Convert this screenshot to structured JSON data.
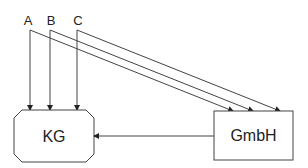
{
  "diagram": {
    "sources": [
      {
        "id": "A",
        "label": "A"
      },
      {
        "id": "B",
        "label": "B"
      },
      {
        "id": "C",
        "label": "C"
      }
    ],
    "nodes": {
      "kg": {
        "label": "KG",
        "shape": "octagon"
      },
      "gmbh": {
        "label": "GmbH",
        "shape": "rectangle"
      }
    },
    "edges": [
      {
        "from": "A",
        "to": "KG"
      },
      {
        "from": "B",
        "to": "KG"
      },
      {
        "from": "C",
        "to": "KG"
      },
      {
        "from": "A",
        "to": "GmbH"
      },
      {
        "from": "B",
        "to": "GmbH"
      },
      {
        "from": "C",
        "to": "GmbH"
      },
      {
        "from": "GmbH",
        "to": "KG"
      }
    ],
    "colors": {
      "line": "#444444",
      "text": "#222222",
      "background": "#ffffff"
    }
  }
}
